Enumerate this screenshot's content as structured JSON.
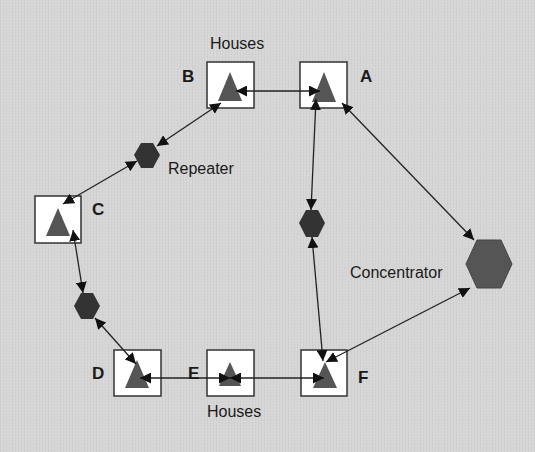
{
  "diagram": {
    "colors": {
      "background": "#d6d6d6",
      "house_box_fill": "#ffffff",
      "house_box_stroke": "#333333",
      "house_triangle": "#555555",
      "repeater_fill": "#333333",
      "concentrator_fill": "#555555",
      "link": "#222222"
    },
    "labels": {
      "houses_top": "Houses",
      "houses_bottom": "Houses",
      "repeater": "Repeater",
      "concentrator": "Concentrator"
    },
    "houses": [
      {
        "id": "A",
        "label": "A",
        "x": 300,
        "y": 62,
        "w": 47,
        "h": 46
      },
      {
        "id": "B",
        "label": "B",
        "x": 207,
        "y": 62,
        "w": 47,
        "h": 46
      },
      {
        "id": "C",
        "label": "C",
        "x": 35,
        "y": 196,
        "w": 46,
        "h": 47
      },
      {
        "id": "D",
        "label": "D",
        "x": 114,
        "y": 350,
        "w": 47,
        "h": 46
      },
      {
        "id": "E",
        "label": "E",
        "x": 207,
        "y": 350,
        "w": 47,
        "h": 46
      },
      {
        "id": "F",
        "label": "F",
        "x": 301,
        "y": 350,
        "w": 46,
        "h": 46
      }
    ],
    "repeaters": [
      {
        "id": "R1",
        "cx": 147,
        "cy": 155,
        "r": 13
      },
      {
        "id": "R2",
        "cx": 312,
        "cy": 223,
        "r": 13
      },
      {
        "id": "R3",
        "cx": 87,
        "cy": 306,
        "r": 13
      }
    ],
    "concentrator": {
      "cx": 489,
      "cy": 264,
      "r": 24
    },
    "links": [
      {
        "from": "B",
        "to": "A",
        "type": "bidirectional"
      },
      {
        "from": "B",
        "to": "R1",
        "type": "bidirectional"
      },
      {
        "from": "R1",
        "to": "C",
        "type": "bidirectional"
      },
      {
        "from": "C",
        "to": "R3",
        "type": "bidirectional"
      },
      {
        "from": "R3",
        "to": "D",
        "type": "bidirectional"
      },
      {
        "from": "D",
        "to": "E",
        "type": "bidirectional"
      },
      {
        "from": "E",
        "to": "F",
        "type": "bidirectional"
      },
      {
        "from": "A",
        "to": "R2",
        "type": "bidirectional"
      },
      {
        "from": "R2",
        "to": "F",
        "type": "bidirectional"
      },
      {
        "from": "A",
        "to": "Concentrator",
        "type": "bidirectional"
      },
      {
        "from": "F",
        "to": "Concentrator",
        "type": "bidirectional"
      }
    ]
  }
}
